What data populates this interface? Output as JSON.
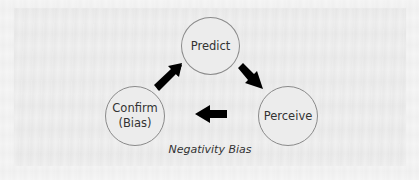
{
  "diagram": {
    "type": "cycle",
    "nodes": [
      {
        "id": "predict",
        "label": "Predict"
      },
      {
        "id": "perceive",
        "label": "Perceive"
      },
      {
        "id": "confirm",
        "label": "Confirm\n(Bias)"
      }
    ],
    "edges": [
      {
        "from": "predict",
        "to": "perceive",
        "icon": "arrow-down-right-icon"
      },
      {
        "from": "perceive",
        "to": "confirm",
        "icon": "arrow-left-icon"
      },
      {
        "from": "confirm",
        "to": "predict",
        "icon": "arrow-up-right-icon"
      }
    ],
    "caption": "Negativity Bias",
    "colors": {
      "node_fill": "#ececec",
      "node_stroke": "#8a8a8a",
      "text": "#333333",
      "arrow": "#000000"
    }
  }
}
